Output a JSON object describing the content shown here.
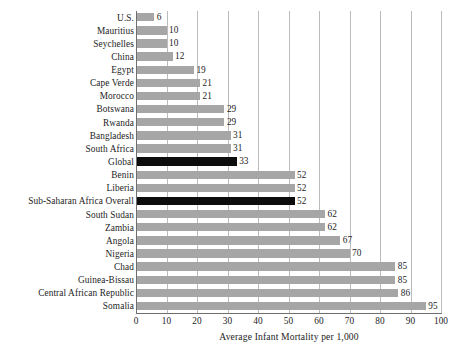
{
  "chart_data": {
    "type": "bar",
    "orientation": "horizontal",
    "title": "",
    "subtitle": "",
    "xlabel": "Average Infant Mortality per 1,000",
    "ylabel": "",
    "xlim": [
      0,
      100
    ],
    "xticks": [
      0,
      10,
      20,
      30,
      40,
      50,
      60,
      70,
      80,
      90,
      100
    ],
    "xtick_labels": [
      "0",
      "10",
      "20",
      "30",
      "40",
      "50",
      "60",
      "70",
      "80",
      "90",
      "100"
    ],
    "grid": true,
    "grid_axis": "x",
    "legend": null,
    "legend_position": "none",
    "categories": [
      "U.S.",
      "Mauritius",
      "Seychelles",
      "China",
      "Egypt",
      "Cape Verde",
      "Morocco",
      "Botswana",
      "Rwanda",
      "Bangladesh",
      "South Africa",
      "Global",
      "Benin",
      "Liberia",
      "Sub-Saharan Africa Overall",
      "South Sudan",
      "Zambia",
      "Angola",
      "Nigeria",
      "Chad",
      "Guinea-Bissau",
      "Central African Republic",
      "Somalia"
    ],
    "values": [
      6,
      10,
      10,
      12,
      19,
      21,
      21,
      29,
      29,
      31,
      31,
      33,
      52,
      52,
      52,
      62,
      62,
      67,
      70,
      85,
      85,
      86,
      95
    ],
    "value_labels": [
      "6",
      "10",
      "10",
      "12",
      "19",
      "21",
      "21",
      "29",
      "29",
      "31",
      "31",
      "33",
      "52",
      "52",
      "52",
      "62",
      "62",
      "67",
      "70",
      "85",
      "85",
      "86",
      "95"
    ],
    "highlighted": [
      "Global",
      "Sub-Saharan Africa Overall"
    ],
    "colors": {
      "bar": "#a6a6a6",
      "bar_highlight": "#0d0d0d",
      "grid": "#bcbcbc",
      "axis": "#6f6f6f",
      "text": "#1c1c1c",
      "background": "#ffffff"
    }
  }
}
